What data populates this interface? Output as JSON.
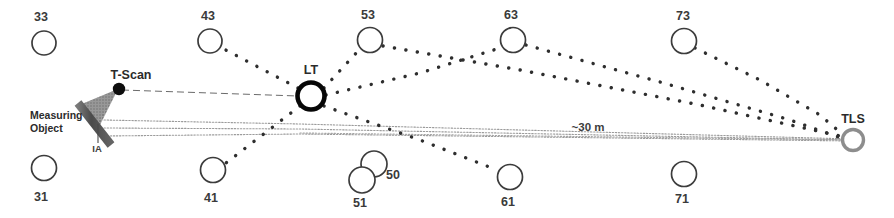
{
  "diagram": {
    "canvas": {
      "width": 894,
      "height": 218
    },
    "colors": {
      "background": "#ffffff",
      "target_stroke": "#3c3c3c",
      "lt_stroke": "#000000",
      "tls_stroke": "#8a8a8a",
      "sight_line": "#4a4a4a",
      "fine_dotted": "#9a9a9a",
      "cone_fill": "#8e8e8e",
      "object_fill": "#5a5a5a",
      "text": "#2b2b2b"
    },
    "instruments": [
      {
        "id": "tscan",
        "label": "T-Scan",
        "kind": "scanner-head",
        "x": 119,
        "y": 89,
        "label_x": 131,
        "label_y": 79
      },
      {
        "id": "lt",
        "label": "LT",
        "kind": "laser-tracker",
        "x": 311,
        "y": 96,
        "r": 14,
        "label_x": 311,
        "label_y": 73
      },
      {
        "id": "tls",
        "label": "TLS",
        "kind": "terrestrial-laser-scanner",
        "x": 853,
        "y": 140,
        "r": 11,
        "label_x": 853,
        "label_y": 122
      }
    ],
    "measuring_object": {
      "label": "Measuring Object",
      "label_line_1": "Measuring",
      "label_line_2": "Object",
      "label_x": 30,
      "label_y_1": 117,
      "label_y_2": 130,
      "ia_label": "IA",
      "ia_label_x": 95,
      "ia_label_y": 151
    },
    "distance_annotation": {
      "text": "~30 m",
      "x": 588,
      "y": 130
    },
    "targets": [
      {
        "id": "t33",
        "label": "33",
        "x": 44,
        "y": 43,
        "r": 12,
        "label_x": 41,
        "label_y": 21,
        "label_pos": "above"
      },
      {
        "id": "t43",
        "label": "43",
        "x": 210,
        "y": 41,
        "r": 12,
        "label_x": 208,
        "label_y": 20,
        "label_pos": "above"
      },
      {
        "id": "t53",
        "label": "53",
        "x": 370,
        "y": 40,
        "r": 13,
        "label_x": 368,
        "label_y": 19,
        "label_pos": "above"
      },
      {
        "id": "t63",
        "label": "63",
        "x": 513,
        "y": 40,
        "r": 13,
        "label_x": 511,
        "label_y": 19,
        "label_pos": "above"
      },
      {
        "id": "t73",
        "label": "73",
        "x": 684,
        "y": 41,
        "r": 13,
        "label_x": 683,
        "label_y": 20,
        "label_pos": "above"
      },
      {
        "id": "t31",
        "label": "31",
        "x": 44,
        "y": 168,
        "r": 13,
        "label_x": 41,
        "label_y": 201,
        "label_pos": "below"
      },
      {
        "id": "t41",
        "label": "41",
        "x": 213,
        "y": 170,
        "r": 13,
        "label_x": 211,
        "label_y": 202,
        "label_pos": "below"
      },
      {
        "id": "t50",
        "label": "50",
        "x": 374,
        "y": 164,
        "r": 13,
        "label_x": 393,
        "label_y": 178,
        "label_pos": "right"
      },
      {
        "id": "t51",
        "label": "51",
        "x": 362,
        "y": 180,
        "r": 13,
        "label_x": 360,
        "label_y": 206,
        "label_pos": "below"
      },
      {
        "id": "t61",
        "label": "61",
        "x": 510,
        "y": 177,
        "r": 13,
        "label_x": 508,
        "label_y": 206,
        "label_pos": "below"
      },
      {
        "id": "t71",
        "label": "71",
        "x": 684,
        "y": 174,
        "r": 13,
        "label_x": 682,
        "label_y": 203,
        "label_pos": "below"
      }
    ],
    "sight_lines": [
      {
        "id": "lt-43",
        "from": "lt",
        "to": "t43",
        "style": "thick-dotted"
      },
      {
        "id": "lt-53",
        "from": "lt",
        "to": "t53",
        "style": "thick-dotted"
      },
      {
        "id": "lt-41",
        "from": "lt",
        "to": "t41",
        "style": "thick-dotted"
      },
      {
        "id": "lt-61",
        "from": "lt",
        "to": "t61",
        "style": "thick-dotted"
      },
      {
        "id": "lt-63",
        "from": "lt",
        "to": "t63",
        "style": "thick-dotted"
      },
      {
        "id": "53-tls",
        "from": "t53",
        "to": "tls",
        "style": "thick-dotted"
      },
      {
        "id": "63-tls",
        "from": "t63",
        "to": "tls",
        "style": "thick-dotted"
      },
      {
        "id": "73-tls",
        "from": "t73",
        "to": "tls",
        "style": "thick-dotted"
      },
      {
        "id": "tscan-lt",
        "from": "tscan",
        "to": "lt",
        "style": "thin-dashed"
      }
    ],
    "scan_rays": [
      {
        "id": "ray-top",
        "style": "fine-dotted"
      },
      {
        "id": "ray-middle",
        "style": "fine-dotted"
      },
      {
        "id": "ray-bottom",
        "style": "fine-dotted"
      }
    ]
  }
}
